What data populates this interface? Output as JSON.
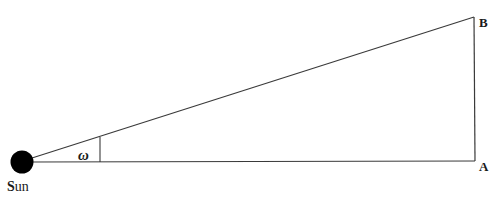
{
  "diagram": {
    "type": "geometry",
    "labels": {
      "sun": "Sun",
      "sun_initial": "S",
      "sun_rest": "un",
      "point_a": "A",
      "point_b": "B",
      "angle": "ω"
    },
    "points": {
      "sun": [
        22,
        162
      ],
      "A": [
        475,
        161
      ],
      "B": [
        474,
        17
      ],
      "angle_marker": [
        100,
        135
      ]
    },
    "colors": {
      "line": "#3a3a3a",
      "sun_fill": "#000000",
      "text": "#1a1a1a"
    }
  }
}
